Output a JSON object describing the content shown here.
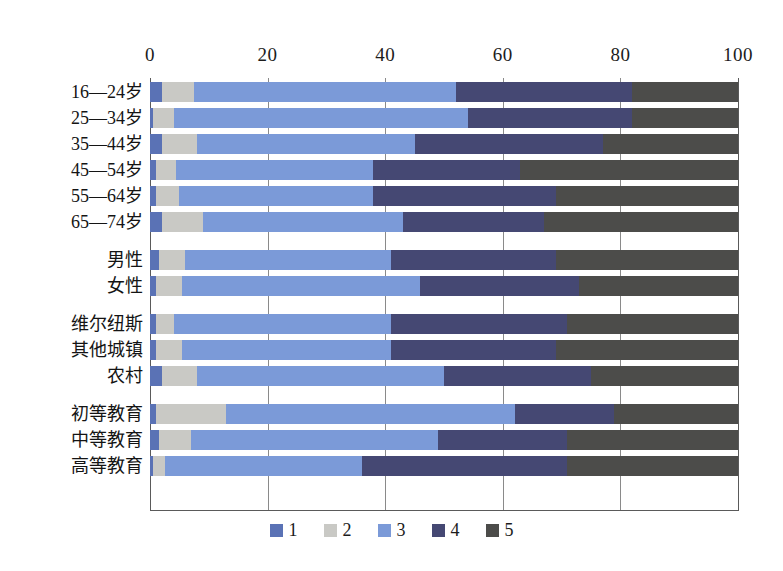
{
  "chart_data": {
    "type": "bar",
    "orientation": "horizontal",
    "stacked": true,
    "stack_mode": "percent",
    "title": "",
    "subtitle": "",
    "xlabel": "",
    "ylabel": "",
    "xlim": [
      0,
      100
    ],
    "xticks": [
      0,
      20,
      40,
      60,
      80,
      100
    ],
    "xtick_labels": [
      "0",
      "20",
      "40",
      "60",
      "80",
      "100"
    ],
    "grid": true,
    "grid_axis": "x",
    "legend_position": "bottom",
    "legend": [
      "1",
      "2",
      "3",
      "4",
      "5"
    ],
    "series_colors": [
      "#5a72b5",
      "#c9c9c5",
      "#7b9ad8",
      "#454873",
      "#4c4c4a"
    ],
    "categories": [
      "16—24岁",
      "25—34岁",
      "35—44岁",
      "45—54岁",
      "55—64岁",
      "65—74岁",
      "男性",
      "女性",
      "维尔纽斯",
      "其他城镇",
      "农村",
      "初等教育",
      "中等教育",
      "高等教育"
    ],
    "series": [
      {
        "name": "1",
        "values": [
          2,
          0.5,
          2,
          1,
          1,
          2,
          1.5,
          1,
          1,
          1,
          2,
          1,
          1.5,
          0.5
        ]
      },
      {
        "name": "2",
        "values": [
          5.5,
          3.5,
          6,
          3.5,
          4,
          7,
          4.5,
          4.5,
          3,
          4.5,
          6,
          12,
          5.5,
          2
        ]
      },
      {
        "name": "3",
        "values": [
          44.5,
          50,
          37,
          33.5,
          33,
          34,
          35,
          40.5,
          37,
          35.5,
          42,
          49,
          42,
          33.5
        ]
      },
      {
        "name": "4",
        "values": [
          30,
          28,
          32,
          25,
          31,
          24,
          28,
          27,
          30,
          28,
          25,
          17,
          22,
          35
        ]
      },
      {
        "name": "5",
        "values": [
          18,
          18,
          23,
          37,
          31,
          33,
          31,
          27,
          29,
          31,
          25,
          21,
          29,
          29
        ]
      }
    ]
  },
  "axis": {
    "ticks": [
      "0",
      "20",
      "40",
      "60",
      "80",
      "100"
    ]
  },
  "legend": {
    "items": [
      {
        "label": "1",
        "color": "#5a72b5"
      },
      {
        "label": "2",
        "color": "#c9c9c5"
      },
      {
        "label": "3",
        "color": "#7b9ad8"
      },
      {
        "label": "4",
        "color": "#454873"
      },
      {
        "label": "5",
        "color": "#4c4c4a"
      }
    ]
  },
  "rows": [
    {
      "label": "16—24岁",
      "group": 0,
      "values": [
        2,
        5.5,
        44.5,
        30,
        18
      ]
    },
    {
      "label": "25—34岁",
      "group": 0,
      "values": [
        0.5,
        3.5,
        50,
        28,
        18
      ]
    },
    {
      "label": "35—44岁",
      "group": 0,
      "values": [
        2,
        6,
        37,
        32,
        23
      ]
    },
    {
      "label": "45—54岁",
      "group": 0,
      "values": [
        1,
        3.5,
        33.5,
        25,
        37
      ]
    },
    {
      "label": "55—64岁",
      "group": 0,
      "values": [
        1,
        4,
        33,
        31,
        31
      ]
    },
    {
      "label": "65—74岁",
      "group": 0,
      "values": [
        2,
        7,
        34,
        24,
        33
      ]
    },
    {
      "label": "男性",
      "group": 1,
      "values": [
        1.5,
        4.5,
        35,
        28,
        31
      ]
    },
    {
      "label": "女性",
      "group": 1,
      "values": [
        1,
        4.5,
        40.5,
        27,
        27
      ]
    },
    {
      "label": "维尔纽斯",
      "group": 2,
      "values": [
        1,
        3,
        37,
        30,
        29
      ]
    },
    {
      "label": "其他城镇",
      "group": 2,
      "values": [
        1,
        4.5,
        35.5,
        28,
        31
      ]
    },
    {
      "label": "农村",
      "group": 2,
      "values": [
        2,
        6,
        42,
        25,
        25
      ]
    },
    {
      "label": "初等教育",
      "group": 3,
      "values": [
        1,
        12,
        49,
        17,
        21
      ]
    },
    {
      "label": "中等教育",
      "group": 3,
      "values": [
        1.5,
        5.5,
        42,
        22,
        29
      ]
    },
    {
      "label": "高等教育",
      "group": 3,
      "values": [
        0.5,
        2,
        33.5,
        35,
        29
      ]
    }
  ]
}
